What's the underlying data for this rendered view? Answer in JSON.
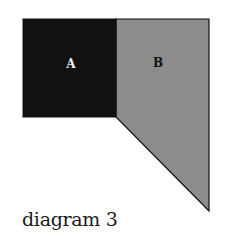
{
  "diagram": {
    "caption": "diagram 3",
    "shapes": [
      {
        "id": "A",
        "label": "A",
        "fill": "#111111",
        "label_color": "#f0f0f0"
      },
      {
        "id": "B",
        "label": "B",
        "fill": "#8c8c8c",
        "label_color": "#111111"
      }
    ],
    "stroke": "#111111"
  }
}
